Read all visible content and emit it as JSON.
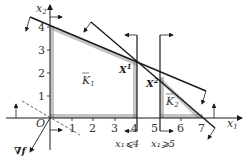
{
  "diagram": {
    "type": "linear-programming-feasible-region",
    "axes": {
      "x_label": "x",
      "x_sub": "1",
      "y_label": "x",
      "y_sub": "2",
      "origin_label": "O",
      "x_ticks": [
        "1",
        "2",
        "3",
        "4",
        "5",
        "6",
        "7"
      ],
      "y_ticks": [
        "1",
        "2",
        "3",
        "4"
      ]
    },
    "regions": [
      {
        "label": "K",
        "sub": "1"
      },
      {
        "label": "K",
        "sub": "2"
      }
    ],
    "points": [
      {
        "label": "X",
        "sup": "1"
      },
      {
        "label": "X",
        "sup": "2"
      }
    ],
    "constraints": [
      {
        "label": "x₁⩽4"
      },
      {
        "label": "x₁⩾5"
      }
    ],
    "gradient_label": "∇f",
    "colors": {
      "line": "#1a1a1a",
      "hatch": "#555555",
      "dashed": "#555555",
      "text": "#333333"
    }
  }
}
